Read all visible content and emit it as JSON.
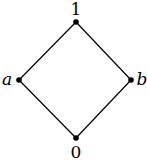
{
  "diagram": {
    "type": "hasse",
    "nodes": [
      {
        "id": "top",
        "label": "1",
        "x": 76,
        "y": 22
      },
      {
        "id": "a",
        "label": "a",
        "x": 19,
        "y": 80
      },
      {
        "id": "b",
        "label": "b",
        "x": 131,
        "y": 80
      },
      {
        "id": "bottom",
        "label": "0",
        "x": 76,
        "y": 138
      }
    ],
    "edges": [
      [
        "top",
        "a"
      ],
      [
        "top",
        "b"
      ],
      [
        "a",
        "bottom"
      ],
      [
        "b",
        "bottom"
      ]
    ],
    "colors": {
      "line": "#000000",
      "node": "#000000",
      "background": "#ffffff"
    }
  }
}
